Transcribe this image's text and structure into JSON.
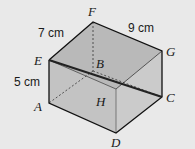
{
  "diagram": {
    "type": "cuboid",
    "vertices": {
      "A": {
        "label": "A",
        "x": 49,
        "y": 103
      },
      "B": {
        "label": "B",
        "x": 93,
        "y": 71
      },
      "C": {
        "label": "C",
        "x": 162,
        "y": 97
      },
      "D": {
        "label": "D",
        "x": 116,
        "y": 133
      },
      "E": {
        "label": "E",
        "x": 49,
        "y": 60
      },
      "F": {
        "label": "F",
        "x": 93,
        "y": 22
      },
      "G": {
        "label": "G",
        "x": 162,
        "y": 51
      },
      "H": {
        "label": "H",
        "x": 116,
        "y": 89
      }
    },
    "dimensions": {
      "EF": "7 cm",
      "FG": "9 cm",
      "AE": "5 cm"
    },
    "highlighted_diagonal": "EC",
    "colors": {
      "background": "#e9e9e9",
      "face_top": "#b8b8b8",
      "face_front": "#c4c4c4",
      "face_side": "#cdcdcd",
      "edge": "#111111"
    }
  }
}
